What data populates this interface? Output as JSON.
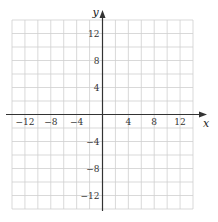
{
  "chart_data": {
    "type": "scatter",
    "title": "",
    "xlabel": "x",
    "ylabel": "y",
    "xlim": [
      -14,
      14
    ],
    "ylim": [
      -14,
      14
    ],
    "grid": true,
    "grid_step": 2,
    "x_ticks": [
      -12,
      -8,
      -4,
      4,
      8,
      12
    ],
    "y_ticks": [
      12,
      8,
      4,
      -4,
      -8,
      -12
    ],
    "x_tick_labels": [
      "−12",
      "−8",
      "−4",
      "4",
      "8",
      "12"
    ],
    "y_tick_labels": [
      "12",
      "8",
      "4",
      "−4",
      "−8",
      "−12"
    ],
    "series": []
  },
  "colors": {
    "grid": "#cfcfcf",
    "axis": "#333333"
  }
}
